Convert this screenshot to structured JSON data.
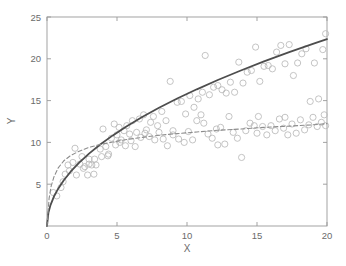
{
  "chart_data": {
    "type": "scatter",
    "title": "",
    "subtitle": "",
    "xlabel": "X",
    "ylabel": "Y",
    "xlim": [
      0,
      20
    ],
    "ylim": [
      0,
      25
    ],
    "xticks": [
      0,
      5,
      10,
      15,
      20
    ],
    "yticks": [
      5,
      10,
      15,
      20,
      25
    ],
    "xtick_labels": [
      "0",
      "5",
      "10",
      "15",
      "20"
    ],
    "ytick_labels": [
      "5",
      "10",
      "15",
      "20",
      "25"
    ],
    "grid": false,
    "legend": "none",
    "legend_position": "none",
    "annotations": [],
    "colors": {
      "axis": "#999999",
      "tick_text": "#6b6b6b",
      "marker": "#b9b9b9",
      "solid_curve": "#4d4d4d",
      "dashed_curve": "#8c8c8c",
      "background": "#ffffff"
    },
    "marker": {
      "shape": "circle-open",
      "size_px": 3.1,
      "edge_color": "#b9b9b9",
      "fill": "none"
    },
    "series": [
      {
        "name": "upper-scatter",
        "type": "scatter",
        "marker": "o",
        "color": "#b9b9b9",
        "points": [
          [
            0.45,
            4.0
          ],
          [
            0.7,
            3.6
          ],
          [
            1.0,
            4.6
          ],
          [
            1.15,
            5.3
          ],
          [
            1.3,
            6.2
          ],
          [
            1.5,
            7.3
          ],
          [
            1.6,
            6.6
          ],
          [
            1.85,
            7.6
          ],
          [
            2.0,
            9.3
          ],
          [
            2.1,
            6.1
          ],
          [
            2.35,
            7.4
          ],
          [
            2.5,
            8.3
          ],
          [
            2.7,
            7.1
          ],
          [
            2.9,
            6.1
          ],
          [
            3.0,
            8.0
          ],
          [
            3.2,
            7.3
          ],
          [
            3.35,
            6.2
          ],
          [
            3.5,
            7.3
          ],
          [
            3.8,
            9.2
          ],
          [
            4.0,
            11.6
          ],
          [
            4.2,
            9.5
          ],
          [
            4.35,
            8.4
          ],
          [
            4.6,
            10.5
          ],
          [
            4.8,
            12.2
          ],
          [
            5.0,
            10.9
          ],
          [
            5.15,
            11.8
          ],
          [
            5.3,
            10.3
          ],
          [
            5.5,
            11.4
          ],
          [
            5.7,
            12.0
          ],
          [
            5.9,
            11.0
          ],
          [
            6.1,
            12.6
          ],
          [
            6.4,
            11.2
          ],
          [
            6.6,
            12.8
          ],
          [
            6.9,
            13.3
          ],
          [
            7.1,
            11.5
          ],
          [
            7.4,
            12.4
          ],
          [
            7.6,
            13.1
          ],
          [
            7.9,
            12.0
          ],
          [
            8.2,
            13.7
          ],
          [
            8.5,
            12.6
          ],
          [
            8.8,
            17.3
          ],
          [
            9.0,
            11.4
          ],
          [
            9.3,
            14.8
          ],
          [
            9.6,
            14.9
          ],
          [
            9.9,
            13.4
          ],
          [
            10.2,
            15.6
          ],
          [
            10.5,
            14.2
          ],
          [
            10.8,
            15.2
          ],
          [
            11.1,
            16.0
          ],
          [
            11.3,
            20.4
          ],
          [
            11.6,
            15.7
          ],
          [
            11.9,
            16.6
          ],
          [
            12.2,
            16.8
          ],
          [
            12.5,
            16.3
          ],
          [
            12.8,
            15.9
          ],
          [
            13.1,
            17.2
          ],
          [
            13.4,
            16.0
          ],
          [
            13.7,
            19.6
          ],
          [
            14.0,
            17.1
          ],
          [
            14.3,
            18.4
          ],
          [
            14.6,
            18.6
          ],
          [
            14.9,
            21.4
          ],
          [
            15.2,
            17.3
          ],
          [
            15.5,
            19.1
          ],
          [
            15.8,
            19.2
          ],
          [
            16.1,
            18.8
          ],
          [
            16.4,
            20.8
          ],
          [
            16.7,
            21.6
          ],
          [
            17.0,
            19.4
          ],
          [
            17.3,
            21.7
          ],
          [
            17.6,
            18.0
          ],
          [
            17.9,
            19.5
          ],
          [
            18.2,
            20.6
          ],
          [
            18.5,
            21.2
          ],
          [
            18.8,
            14.9
          ],
          [
            19.1,
            19.5
          ],
          [
            19.4,
            15.2
          ],
          [
            19.7,
            21.1
          ],
          [
            19.9,
            23.0
          ]
        ]
      },
      {
        "name": "lower-scatter",
        "type": "scatter",
        "marker": "o",
        "color": "#b9b9b9",
        "points": [
          [
            3.4,
            8.0
          ],
          [
            4.4,
            8.6
          ],
          [
            4.9,
            9.7
          ],
          [
            5.2,
            10.0
          ],
          [
            5.6,
            9.6
          ],
          [
            6.0,
            10.2
          ],
          [
            6.3,
            9.5
          ],
          [
            6.7,
            10.6
          ],
          [
            7.0,
            11.1
          ],
          [
            7.3,
            10.7
          ],
          [
            7.7,
            10.3
          ],
          [
            8.0,
            11.2
          ],
          [
            8.3,
            10.4
          ],
          [
            8.6,
            9.6
          ],
          [
            9.0,
            10.9
          ],
          [
            9.4,
            10.4
          ],
          [
            9.8,
            10.0
          ],
          [
            10.1,
            11.3
          ],
          [
            10.4,
            10.3
          ],
          [
            10.7,
            12.6
          ],
          [
            11.0,
            13.3
          ],
          [
            11.2,
            12.3
          ],
          [
            11.5,
            11.0
          ],
          [
            11.8,
            10.5
          ],
          [
            12.1,
            11.6
          ],
          [
            12.4,
            11.8
          ],
          [
            12.7,
            9.8
          ],
          [
            13.0,
            13.1
          ],
          [
            13.3,
            11.2
          ],
          [
            13.6,
            10.5
          ],
          [
            13.9,
            8.2
          ],
          [
            14.2,
            11.4
          ],
          [
            14.5,
            12.3
          ],
          [
            14.8,
            12.0
          ],
          [
            15.1,
            13.1
          ],
          [
            15.4,
            11.9
          ],
          [
            15.7,
            10.9
          ],
          [
            16.0,
            12.0
          ],
          [
            16.3,
            11.4
          ],
          [
            16.6,
            12.8
          ],
          [
            16.9,
            11.7
          ],
          [
            17.2,
            10.9
          ],
          [
            17.5,
            12.2
          ],
          [
            17.8,
            11.1
          ],
          [
            18.1,
            12.7
          ],
          [
            18.4,
            11.5
          ],
          [
            18.7,
            12.1
          ],
          [
            19.0,
            13.0
          ],
          [
            19.3,
            11.9
          ],
          [
            19.6,
            12.4
          ],
          [
            19.9,
            12.0
          ],
          [
            2.6,
            6.9
          ],
          [
            3.0,
            7.4
          ],
          [
            3.9,
            8.3
          ],
          [
            12.2,
            9.7
          ],
          [
            15.0,
            11.1
          ],
          [
            17.0,
            13.0
          ],
          [
            19.8,
            13.3
          ]
        ]
      },
      {
        "name": "solid-fit-curve",
        "type": "line",
        "linestyle": "solid",
        "color": "#4d4d4d",
        "linewidth": 1.8,
        "equation": "y = 5*sqrt(x)",
        "points": [
          [
            0,
            0
          ],
          [
            0.1,
            1.58
          ],
          [
            0.25,
            2.5
          ],
          [
            0.5,
            3.54
          ],
          [
            0.8,
            4.47
          ],
          [
            1.2,
            5.48
          ],
          [
            1.7,
            6.52
          ],
          [
            2.3,
            7.58
          ],
          [
            3.0,
            8.66
          ],
          [
            3.8,
            9.75
          ],
          [
            4.7,
            10.84
          ],
          [
            5.7,
            11.94
          ],
          [
            6.8,
            13.04
          ],
          [
            8.0,
            14.14
          ],
          [
            9.3,
            15.25
          ],
          [
            10.7,
            16.35
          ],
          [
            12.2,
            17.46
          ],
          [
            13.8,
            18.57
          ],
          [
            15.5,
            19.69
          ],
          [
            17.3,
            20.8
          ],
          [
            19.2,
            21.91
          ],
          [
            20,
            22.36
          ]
        ]
      },
      {
        "name": "dashed-fit-curve",
        "type": "line",
        "linestyle": "dashed",
        "color": "#8c8c8c",
        "linewidth": 1.1,
        "equation": "y = 13.2*x/(x+1.1)",
        "points": [
          [
            0,
            0
          ],
          [
            0.15,
            3.3
          ],
          [
            0.3,
            4.8
          ],
          [
            0.5,
            5.9
          ],
          [
            0.8,
            6.95
          ],
          [
            1.2,
            7.8
          ],
          [
            1.7,
            8.45
          ],
          [
            2.3,
            8.95
          ],
          [
            3.0,
            9.4
          ],
          [
            3.8,
            9.75
          ],
          [
            4.7,
            10.05
          ],
          [
            5.7,
            10.35
          ],
          [
            6.8,
            10.6
          ],
          [
            8.0,
            10.85
          ],
          [
            9.3,
            11.05
          ],
          [
            10.7,
            11.25
          ],
          [
            12.2,
            11.45
          ],
          [
            13.8,
            11.6
          ],
          [
            15.5,
            11.8
          ],
          [
            17.3,
            11.95
          ],
          [
            19.0,
            12.1
          ],
          [
            20,
            12.25
          ]
        ]
      }
    ]
  },
  "axes": {
    "x_label": "X",
    "y_label": "Y"
  }
}
